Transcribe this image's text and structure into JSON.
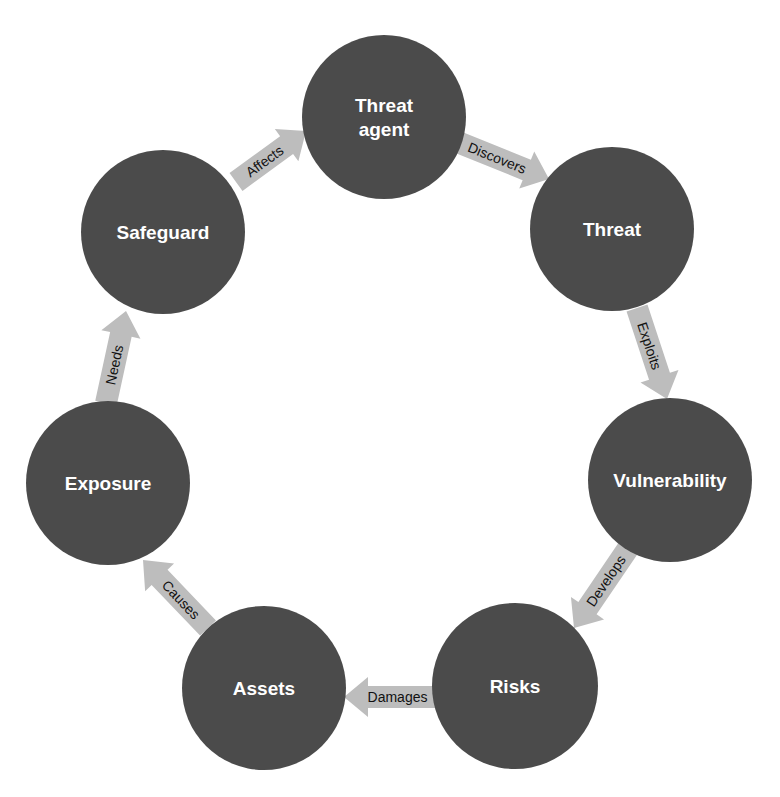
{
  "diagram": {
    "type": "cycle",
    "colors": {
      "node_fill": "#4b4b4b",
      "node_text": "#ffffff",
      "arrow_fill": "#bdbdbd",
      "arrow_text": "#111111",
      "background": "#ffffff"
    },
    "nodes": [
      {
        "id": "threat-agent",
        "lines": [
          "Threat",
          "agent"
        ],
        "cx": 384,
        "cy": 117,
        "r": 82
      },
      {
        "id": "threat",
        "lines": [
          "Threat"
        ],
        "cx": 612,
        "cy": 229,
        "r": 82
      },
      {
        "id": "vulnerability",
        "lines": [
          "Vulnerability"
        ],
        "cx": 670,
        "cy": 480,
        "r": 82
      },
      {
        "id": "risks",
        "lines": [
          "Risks"
        ],
        "cx": 515,
        "cy": 686,
        "r": 83
      },
      {
        "id": "assets",
        "lines": [
          "Assets"
        ],
        "cx": 264,
        "cy": 688,
        "r": 82
      },
      {
        "id": "exposure",
        "lines": [
          "Exposure"
        ],
        "cx": 108,
        "cy": 483,
        "r": 82
      },
      {
        "id": "safeguard",
        "lines": [
          "Safeguard"
        ],
        "cx": 163,
        "cy": 232,
        "r": 82
      }
    ],
    "edges": [
      {
        "from": "safeguard",
        "to": "threat-agent",
        "label": "Affects",
        "x1": 236,
        "y1": 182,
        "x2": 306,
        "y2": 131
      },
      {
        "from": "threat-agent",
        "to": "threat",
        "label": "Discovers",
        "x1": 460,
        "y1": 143,
        "x2": 549,
        "y2": 179
      },
      {
        "from": "threat",
        "to": "vulnerability",
        "label": "Exploits",
        "x1": 637,
        "y1": 308,
        "x2": 667,
        "y2": 399
      },
      {
        "from": "vulnerability",
        "to": "risks",
        "label": "Develops",
        "x1": 629,
        "y1": 547,
        "x2": 574,
        "y2": 628
      },
      {
        "from": "risks",
        "to": "assets",
        "label": "Damages",
        "x1": 435,
        "y1": 697,
        "x2": 344,
        "y2": 697
      },
      {
        "from": "assets",
        "to": "exposure",
        "label": "Causes",
        "x1": 208,
        "y1": 628,
        "x2": 143,
        "y2": 560
      },
      {
        "from": "exposure",
        "to": "safeguard",
        "label": "Needs",
        "x1": 106,
        "y1": 403,
        "x2": 126,
        "y2": 311
      }
    ]
  }
}
